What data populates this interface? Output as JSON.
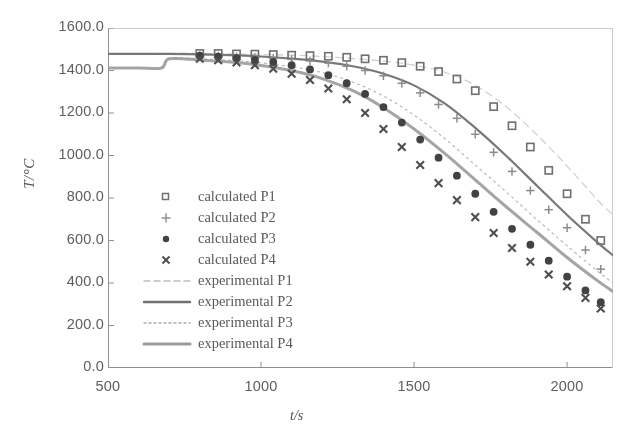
{
  "chart_data": {
    "type": "scatter",
    "title": "",
    "xlabel": "t/s",
    "ylabel": "T/°C",
    "xlim": [
      500,
      2150
    ],
    "ylim": [
      0,
      1600
    ],
    "xticks": [
      500,
      1000,
      1500,
      2000
    ],
    "xtick_labels": [
      "500",
      "1000",
      "1500",
      "2000"
    ],
    "yticks": [
      0,
      200,
      400,
      600,
      800,
      1000,
      1200,
      1400,
      1600
    ],
    "ytick_labels": [
      "0.0",
      "200.0",
      "400.0",
      "600.0",
      "800.0",
      "1000.0",
      "1200.0",
      "1400.0",
      "1600.0"
    ],
    "grid": false,
    "legend_position": "center-left",
    "series": [
      {
        "name": "calculated P1",
        "marker": "open-square",
        "style": "markers",
        "color": "#6b6b6b",
        "x": [
          800,
          860,
          920,
          980,
          1040,
          1100,
          1160,
          1220,
          1280,
          1340,
          1400,
          1460,
          1520,
          1580,
          1640,
          1700,
          1760,
          1820,
          1880,
          1940,
          2000,
          2060,
          2110
        ],
        "y": [
          1480,
          1480,
          1478,
          1477,
          1475,
          1472,
          1470,
          1467,
          1462,
          1455,
          1448,
          1437,
          1420,
          1395,
          1360,
          1305,
          1230,
          1140,
          1040,
          930,
          820,
          700,
          600
        ]
      },
      {
        "name": "calculated P2",
        "marker": "plus",
        "style": "markers",
        "color": "#8a8a8a",
        "x": [
          800,
          860,
          920,
          980,
          1040,
          1100,
          1160,
          1220,
          1280,
          1340,
          1400,
          1460,
          1520,
          1580,
          1640,
          1700,
          1760,
          1820,
          1880,
          1940,
          2000,
          2060,
          2110
        ],
        "y": [
          1470,
          1468,
          1465,
          1462,
          1458,
          1452,
          1445,
          1435,
          1420,
          1400,
          1375,
          1340,
          1295,
          1240,
          1175,
          1100,
          1015,
          925,
          835,
          745,
          660,
          555,
          465
        ]
      },
      {
        "name": "calculated P3",
        "marker": "filled-circle",
        "style": "markers",
        "color": "#3c3c3c",
        "x": [
          800,
          860,
          920,
          980,
          1040,
          1100,
          1160,
          1220,
          1280,
          1340,
          1400,
          1460,
          1520,
          1580,
          1640,
          1700,
          1760,
          1820,
          1880,
          1940,
          2000,
          2060,
          2110
        ],
        "y": [
          1470,
          1465,
          1458,
          1450,
          1440,
          1425,
          1405,
          1378,
          1340,
          1290,
          1228,
          1155,
          1075,
          990,
          905,
          820,
          735,
          655,
          580,
          505,
          430,
          365,
          310
        ]
      },
      {
        "name": "calculated P4",
        "marker": "x",
        "style": "markers",
        "color": "#4a4a4a",
        "x": [
          800,
          860,
          920,
          980,
          1040,
          1100,
          1160,
          1220,
          1280,
          1340,
          1400,
          1460,
          1520,
          1580,
          1640,
          1700,
          1760,
          1820,
          1880,
          1940,
          2000,
          2060,
          2110
        ],
        "y": [
          1455,
          1448,
          1438,
          1425,
          1408,
          1385,
          1355,
          1315,
          1265,
          1200,
          1125,
          1040,
          955,
          870,
          790,
          710,
          635,
          565,
          500,
          440,
          385,
          330,
          280
        ]
      },
      {
        "name": "experimental P1",
        "marker": "none",
        "style": "dashed-light",
        "color": "#bdbdbd",
        "x": [
          500,
          600,
          675,
          700,
          800,
          900,
          1000,
          1100,
          1200,
          1300,
          1400,
          1500,
          1600,
          1700,
          1800,
          1900,
          2000,
          2100,
          2150
        ],
        "y": [
          1478,
          1478,
          1478,
          1480,
          1480,
          1478,
          1475,
          1472,
          1466,
          1456,
          1444,
          1425,
          1392,
          1330,
          1230,
          1100,
          950,
          790,
          720
        ]
      },
      {
        "name": "experimental P2",
        "marker": "none",
        "style": "solid-dark",
        "color": "#6e6e6e",
        "x": [
          500,
          600,
          675,
          700,
          800,
          900,
          1000,
          1100,
          1200,
          1300,
          1400,
          1500,
          1600,
          1700,
          1800,
          1900,
          2000,
          2100,
          2150
        ],
        "y": [
          1478,
          1478,
          1478,
          1478,
          1476,
          1472,
          1466,
          1456,
          1442,
          1420,
          1385,
          1330,
          1245,
          1130,
          1000,
          860,
          720,
          590,
          530
        ]
      },
      {
        "name": "experimental P3",
        "marker": "none",
        "style": "dotted",
        "color": "#a8a8a8",
        "x": [
          500,
          600,
          675,
          700,
          800,
          900,
          1000,
          1100,
          1200,
          1300,
          1400,
          1500,
          1600,
          1700,
          1800,
          1900,
          2000,
          2100,
          2150
        ],
        "y": [
          1412,
          1412,
          1412,
          1458,
          1455,
          1448,
          1436,
          1418,
          1390,
          1345,
          1280,
          1190,
          1080,
          955,
          830,
          700,
          575,
          455,
          400
        ]
      },
      {
        "name": "experimental P4",
        "marker": "none",
        "style": "solid-gray",
        "color": "#9a9a9a",
        "x": [
          500,
          600,
          675,
          700,
          800,
          900,
          1000,
          1100,
          1200,
          1300,
          1400,
          1500,
          1600,
          1700,
          1800,
          1900,
          2000,
          2100,
          2150
        ],
        "y": [
          1412,
          1412,
          1412,
          1455,
          1450,
          1440,
          1424,
          1400,
          1362,
          1305,
          1225,
          1125,
          1010,
          885,
          760,
          640,
          520,
          410,
          360
        ]
      }
    ]
  },
  "legend": {
    "entries": [
      {
        "label": "calculated P1",
        "symbol": "open-square"
      },
      {
        "label": "calculated P2",
        "symbol": "plus"
      },
      {
        "label": "calculated P3",
        "symbol": "filled-circle"
      },
      {
        "label": "calculated P4",
        "symbol": "x"
      },
      {
        "label": "experimental P1",
        "symbol": "dashed-light"
      },
      {
        "label": "experimental P2",
        "symbol": "solid-dark"
      },
      {
        "label": "experimental P3",
        "symbol": "dotted"
      },
      {
        "label": "experimental P4",
        "symbol": "solid-gray"
      }
    ]
  }
}
